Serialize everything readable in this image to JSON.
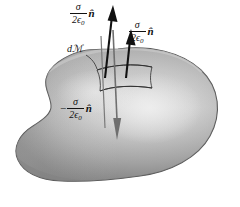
{
  "figure": {
    "background_color": "#ffffff",
    "blob": {
      "name": "gaussian-surface-blob",
      "shape": "kidney-bean",
      "fill_light": "#e3e3e3",
      "fill_mid": "#b4b4b4",
      "fill_dark": "#8d8d8d",
      "outline_color": "#5a5a5a"
    },
    "patch": {
      "name": "surface-element-patch",
      "outline_color": "#3a3a3a",
      "label": "dℳ"
    },
    "arrows": [
      {
        "id": "arrow-up-tall",
        "direction": "up",
        "color": "#111111",
        "description": "tall black upward arrow through patch"
      },
      {
        "id": "arrow-up-short",
        "direction": "up",
        "color": "#111111",
        "description": "shorter black upward arrow right of the tall one"
      },
      {
        "id": "arrow-down",
        "direction": "down",
        "color": "#6f6f6f",
        "description": "gray downward arrow into the blob interior"
      }
    ]
  },
  "labels": {
    "up_left": {
      "minus": "",
      "numerator": "σ",
      "denominator": "2ϵ",
      "denominator_sub": "0",
      "vector": "n̂",
      "full_text": "σ/2ϵ₀ n̂"
    },
    "up_right": {
      "minus": "",
      "numerator": "σ",
      "denominator": "2ϵ",
      "denominator_sub": "0",
      "vector": "n̂",
      "full_text": "σ/2ϵ₀ n̂"
    },
    "down": {
      "minus": "−",
      "numerator": "σ",
      "denominator": "2ϵ",
      "denominator_sub": "0",
      "vector": "n̂",
      "full_text": "−σ/2ϵ₀ n̂"
    },
    "area_element": {
      "d": "d",
      "script_a": "ℳ",
      "full_text": "dℳ"
    }
  }
}
